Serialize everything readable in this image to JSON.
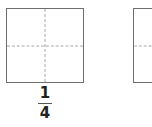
{
  "figure": {
    "squares": [
      {
        "id": "square-1",
        "divisions": 4,
        "label": {
          "numerator": "1",
          "denominator": "4"
        }
      },
      {
        "id": "square-2",
        "divisions": 4,
        "label": null
      }
    ],
    "colors": {
      "border": "#6e6e6e",
      "dashes": "#a8a8a8",
      "text": "#222222",
      "background": "#ffffff"
    }
  }
}
